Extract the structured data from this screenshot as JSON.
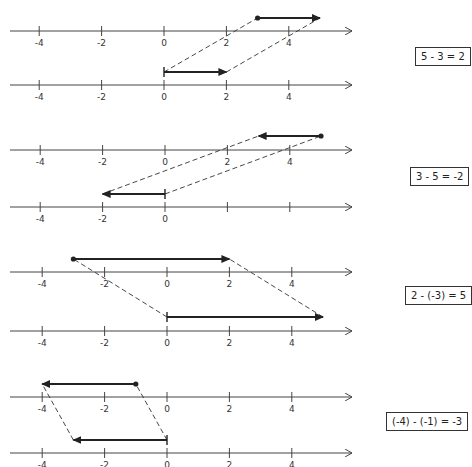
{
  "diagram": {
    "axis_ticks": [
      -4,
      -2,
      0,
      2,
      4
    ],
    "panels": [
      {
        "equation": "5 - 3 = 2",
        "top_axis_labels": [
          "-4",
          "-2",
          "0",
          "2",
          "4"
        ],
        "bottom_axis_labels": [
          "-4",
          "-2",
          "0",
          "2",
          "4"
        ],
        "top_vector": {
          "from": 3,
          "to": 5
        },
        "bottom_vector": {
          "from": 0,
          "to": 2
        }
      },
      {
        "equation": "3 - 5 = -2",
        "top_axis_labels": [
          "-4",
          "-2",
          "0",
          "2",
          "4"
        ],
        "bottom_axis_labels": [
          "-4",
          "-2",
          "0",
          "",
          ""
        ],
        "top_vector": {
          "from": 5,
          "to": 3
        },
        "bottom_vector": {
          "from": 0,
          "to": -2
        }
      },
      {
        "equation": "2 - (-3) = 5",
        "top_axis_labels": [
          "-4",
          "-2",
          "0",
          "2",
          "4"
        ],
        "bottom_axis_labels": [
          "-4",
          "-2",
          "0",
          "2",
          "4"
        ],
        "top_vector": {
          "from": -3,
          "to": 2
        },
        "bottom_vector": {
          "from": 0,
          "to": 5
        }
      },
      {
        "equation": "(-4) - (-1) = -3",
        "top_axis_labels": [
          "-4",
          "-2",
          "0",
          "2",
          "4"
        ],
        "bottom_axis_labels": [
          "-4",
          "-2",
          "0",
          "2",
          "4"
        ],
        "top_vector": {
          "from": -1,
          "to": -4
        },
        "bottom_vector": {
          "from": 0,
          "to": -3
        }
      }
    ],
    "colors": {
      "ink": "#222222",
      "axis": "#444444",
      "dash": "#333333"
    }
  }
}
